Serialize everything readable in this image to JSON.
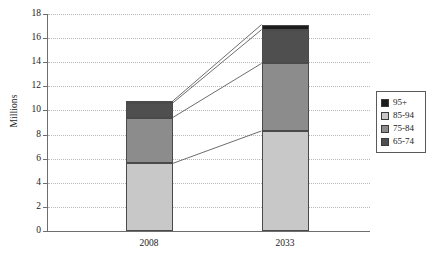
{
  "chart_data": {
    "type": "bar",
    "stacked": true,
    "title": "",
    "xlabel": "",
    "ylabel": "Millions",
    "categories": [
      "2008",
      "2033"
    ],
    "ylim": [
      0,
      18
    ],
    "yticks": [
      0,
      2,
      4,
      6,
      8,
      10,
      12,
      14,
      16,
      18
    ],
    "ytick_labels": [
      "0",
      "2",
      "4",
      "6",
      "8",
      "10",
      "12",
      "14",
      "16",
      "18"
    ],
    "grid": true,
    "grid_style": "dotted-horizontal",
    "legend_position": "right",
    "series": [
      {
        "name": "65-74",
        "values": [
          5.6,
          8.3
        ],
        "color": "#c8c8c8"
      },
      {
        "name": "75-84",
        "values": [
          3.8,
          5.6
        ],
        "color": "#8c8c8c"
      },
      {
        "name": "85-94",
        "values": [
          1.2,
          2.8
        ],
        "color": "#4f4f4f"
      },
      {
        "name": "95+",
        "values": [
          0.16,
          0.42
        ],
        "color": "#1c1c1c"
      }
    ],
    "stack_tops": {
      "2008": [
        5.6,
        9.4,
        10.6,
        10.76
      ],
      "2033": [
        8.3,
        13.9,
        16.7,
        17.12
      ]
    },
    "totals": [
      10.76,
      17.12
    ],
    "connector_lines": [
      {
        "from_value": 5.6,
        "to_value": 8.3
      },
      {
        "from_value": 9.4,
        "to_value": 13.9
      },
      {
        "from_value": 10.6,
        "to_value": 16.7
      },
      {
        "from_value": 10.76,
        "to_value": 17.12
      }
    ]
  },
  "legend": {
    "items": [
      {
        "label": "95+",
        "color": "#1c1c1c"
      },
      {
        "label": "85-94",
        "color": "#c8c8c8"
      },
      {
        "label": "75-84",
        "color": "#8c8c8c"
      },
      {
        "label": "65-74",
        "color": "#4f4f4f"
      }
    ]
  },
  "axis": {
    "y_title": "Millions"
  }
}
